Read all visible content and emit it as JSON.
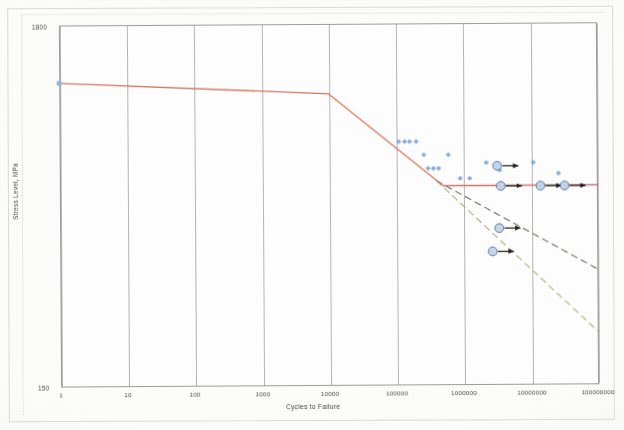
{
  "figure": {
    "type": "scanned-chart"
  },
  "axes": {
    "x_title": "Cycles to Failure",
    "y_title": "Stress Level, MPa",
    "x_ticks": [
      "1",
      "10",
      "100",
      "1000",
      "10000",
      "100000",
      "1000000",
      "10000000",
      "100000000"
    ],
    "y_ticks_visible": [
      "1800",
      "150"
    ]
  },
  "chart_data": {
    "type": "line",
    "title": "",
    "subtitle": "",
    "xlabel": "Cycles to Failure",
    "ylabel": "Stress Level, MPa",
    "x_scale": "log",
    "y_scale": "log",
    "xlim": [
      1,
      100000000
    ],
    "ylim": [
      150,
      1800
    ],
    "x_tick_labels": [
      "1",
      "10",
      "100",
      "1000",
      "10000",
      "100000",
      "1000000",
      "10000000",
      "100000000"
    ],
    "y_tick_labels": [
      "1800",
      "150"
    ],
    "grid": "vertical-only",
    "legend": "none",
    "series": [
      {
        "name": "S-N design curve",
        "type": "line",
        "style": "solid",
        "color": "#d4705a",
        "points": [
          {
            "x": 1,
            "y": 1210
          },
          {
            "x": 10000,
            "y": 1115
          },
          {
            "x": 500000,
            "y": 590
          },
          {
            "x": 100000000,
            "y": 590
          }
        ]
      },
      {
        "name": "Extrapolation A",
        "type": "line",
        "style": "dashed",
        "color": "#6f6f63",
        "points": [
          {
            "x": 400000,
            "y": 610
          },
          {
            "x": 100000000,
            "y": 330
          }
        ]
      },
      {
        "name": "Extrapolation B",
        "type": "line",
        "style": "dashed",
        "color": "#b5ad7a",
        "points": [
          {
            "x": 400000,
            "y": 610
          },
          {
            "x": 100000000,
            "y": 215
          }
        ]
      },
      {
        "name": "Test data (failures)",
        "type": "scatter",
        "marker": "diamond",
        "color": "#7fa8d4",
        "points": [
          {
            "x": 1,
            "y": 1210
          },
          {
            "x": 110000,
            "y": 800
          },
          {
            "x": 135000,
            "y": 800
          },
          {
            "x": 160000,
            "y": 800
          },
          {
            "x": 200000,
            "y": 800
          },
          {
            "x": 260000,
            "y": 730
          },
          {
            "x": 600000,
            "y": 730
          },
          {
            "x": 300000,
            "y": 665
          },
          {
            "x": 360000,
            "y": 665
          },
          {
            "x": 430000,
            "y": 665
          },
          {
            "x": 900000,
            "y": 620
          },
          {
            "x": 1250000,
            "y": 620
          },
          {
            "x": 2200000,
            "y": 690
          },
          {
            "x": 3500000,
            "y": 655
          },
          {
            "x": 11000000,
            "y": 690
          },
          {
            "x": 26000000,
            "y": 640
          }
        ]
      },
      {
        "name": "Run-outs (no failure)",
        "type": "scatter",
        "marker": "circle-with-arrow",
        "color": "#c3d4ea",
        "points": [
          {
            "x": 3200000,
            "y": 675
          },
          {
            "x": 3600000,
            "y": 588
          },
          {
            "x": 14000000,
            "y": 588
          },
          {
            "x": 32000000,
            "y": 588
          },
          {
            "x": 3400000,
            "y": 440
          },
          {
            "x": 2700000,
            "y": 375
          }
        ]
      }
    ]
  }
}
